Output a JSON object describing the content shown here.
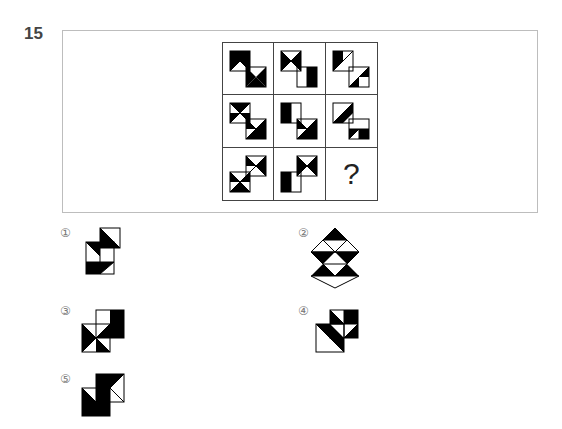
{
  "question": {
    "number": "15",
    "missing_marker": "?",
    "grid_cells": [
      {
        "row": 1,
        "col": 1,
        "figure": "figure-r1c1"
      },
      {
        "row": 1,
        "col": 2,
        "figure": "figure-r1c2"
      },
      {
        "row": 1,
        "col": 3,
        "figure": "figure-r1c3"
      },
      {
        "row": 2,
        "col": 1,
        "figure": "figure-r2c1"
      },
      {
        "row": 2,
        "col": 2,
        "figure": "figure-r2c2"
      },
      {
        "row": 2,
        "col": 3,
        "figure": "figure-r2c3"
      },
      {
        "row": 3,
        "col": 1,
        "figure": "figure-r3c1"
      },
      {
        "row": 3,
        "col": 2,
        "figure": "figure-r3c2"
      },
      {
        "row": 3,
        "col": 3,
        "figure": "missing"
      }
    ]
  },
  "options": [
    {
      "label": "①",
      "figure": "option-1"
    },
    {
      "label": "②",
      "figure": "option-2"
    },
    {
      "label": "③",
      "figure": "option-3"
    },
    {
      "label": "④",
      "figure": "option-4"
    },
    {
      "label": "⑤",
      "figure": "option-5"
    }
  ],
  "colors": {
    "fill": "#000000",
    "line": "#000000",
    "frame": "#bdbdbd"
  }
}
